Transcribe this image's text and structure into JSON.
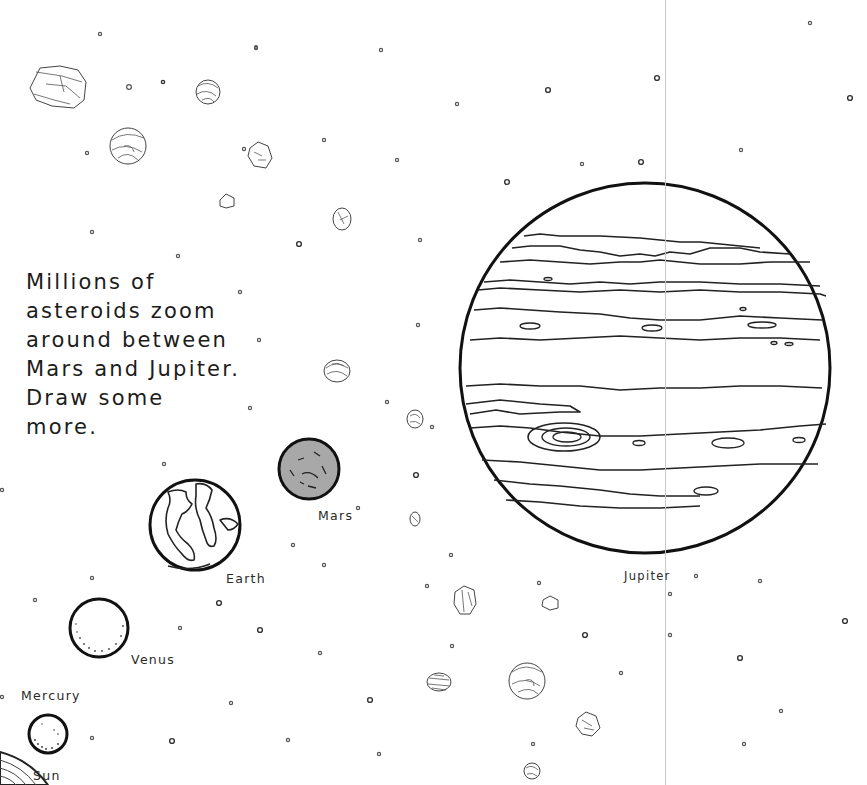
{
  "page": {
    "caption": "Millions of\nasteroids zoom\naround between\nMars and Jupiter.\nDraw some\nmore.",
    "caption_lines": [
      "Millions of",
      "asteroids zoom",
      "around between",
      "Mars and Jupiter.",
      "Draw some",
      "more."
    ]
  },
  "planets": {
    "sun": {
      "label": "Sun"
    },
    "mercury": {
      "label": "Mercury"
    },
    "venus": {
      "label": "Venus"
    },
    "earth": {
      "label": "Earth"
    },
    "mars": {
      "label": "Mars",
      "fill_color": "#a8a8a8"
    },
    "jupiter": {
      "label": "Jupiter"
    }
  },
  "colors": {
    "background": "#ffffff",
    "ink": "#111111",
    "mars_fill": "#a8a8a8",
    "fold_line": "#c8c8c8"
  }
}
